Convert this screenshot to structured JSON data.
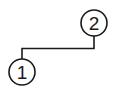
{
  "diagram": {
    "nodes": [
      {
        "id": "node-1",
        "label": "1",
        "cx": 22,
        "cy": 72,
        "r": 13
      },
      {
        "id": "node-2",
        "label": "2",
        "cx": 94,
        "cy": 23,
        "r": 13
      }
    ],
    "edges": [
      {
        "from": "node-2",
        "to": "node-1",
        "style": "elbow"
      }
    ],
    "colors": {
      "stroke": "#1a1a1a",
      "background": "#ffffff"
    }
  }
}
